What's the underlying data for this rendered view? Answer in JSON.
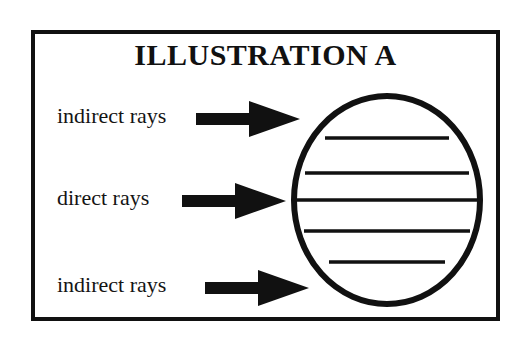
{
  "figure": {
    "title": "ILLUSTRATION A",
    "frame_color": "#111111",
    "background_color": "#ffffff",
    "ink_color": "#111111"
  },
  "labels": [
    {
      "id": "indirect-top",
      "text": "indirect rays",
      "arrow": "arrow-right-solid"
    },
    {
      "id": "direct-middle",
      "text": "direct rays",
      "arrow": "arrow-right-solid"
    },
    {
      "id": "indirect-bottom",
      "text": "indirect rays",
      "arrow": "arrow-right-solid"
    }
  ],
  "globe": {
    "name": "earth-sphere",
    "latitude_line_count": 5,
    "stroke_color": "#111111"
  }
}
